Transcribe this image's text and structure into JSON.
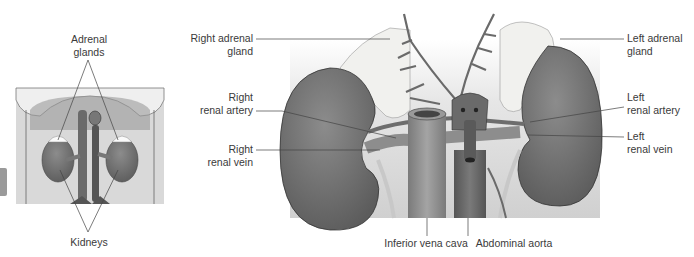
{
  "overview": {
    "labels": {
      "adrenal": [
        "Adrenal",
        "glands"
      ],
      "kidneys": "Kidneys"
    }
  },
  "detail": {
    "labels": {
      "right_adrenal": [
        "Right adrenal",
        "gland"
      ],
      "right_artery": [
        "Right",
        "renal artery"
      ],
      "right_vein": [
        "Right",
        "renal vein"
      ],
      "left_adrenal": [
        "Left adrenal",
        "gland"
      ],
      "left_artery": [
        "Left",
        "renal artery"
      ],
      "left_vein": [
        "Left",
        "renal vein"
      ],
      "ivc": "Inferior vena cava",
      "aorta": "Abdominal aorta"
    }
  },
  "colors": {
    "kidney": "#6e6e6e",
    "vessel": "#8a8a8a",
    "adrenal": "#f1f1ee",
    "background_tint": "#d8d8d8",
    "leader_line": "#555555"
  }
}
